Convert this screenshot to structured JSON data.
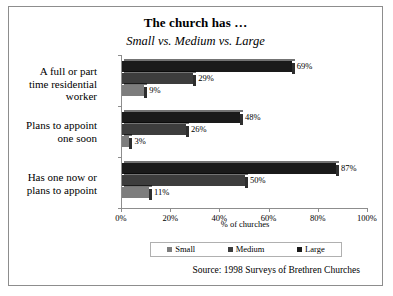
{
  "chart_data": {
    "type": "bar",
    "orientation": "horizontal",
    "title": "The church has …",
    "subtitle": "Small vs. Medium vs. Large",
    "xlabel": "% of churches",
    "ylabel": "",
    "xlim": [
      0,
      100
    ],
    "xticks": [
      "0%",
      "20%",
      "40%",
      "60%",
      "80%",
      "100%"
    ],
    "xtick_values": [
      0,
      20,
      40,
      60,
      80,
      100
    ],
    "grid": false,
    "legend_position": "bottom",
    "categories": [
      "A full or part time residential worker",
      "Plans to appoint one soon",
      "Has one now or plans to appoint"
    ],
    "series": [
      {
        "name": "Small",
        "color": "#7d7d7d",
        "values": [
          9,
          3,
          11
        ],
        "labels": [
          "9%",
          "3%",
          "11%"
        ]
      },
      {
        "name": "Medium",
        "color": "#3d3d3d",
        "values": [
          29,
          26,
          50
        ],
        "labels": [
          "29%",
          "26%",
          "50%"
        ]
      },
      {
        "name": "Large",
        "color": "#1a1a1a",
        "values": [
          69,
          48,
          87
        ],
        "labels": [
          "69%",
          "48%",
          "87%"
        ]
      }
    ],
    "source": "Source: 1998 Surveys of Brethren Churches"
  },
  "labels": {
    "cat0_line1": "A full or part",
    "cat0_line2": "time residential",
    "cat0_line3": "worker",
    "cat1_line1": "Plans to appoint",
    "cat1_line2": "one soon",
    "cat2_line1": "Has one now or",
    "cat2_line2": "plans to appoint"
  }
}
